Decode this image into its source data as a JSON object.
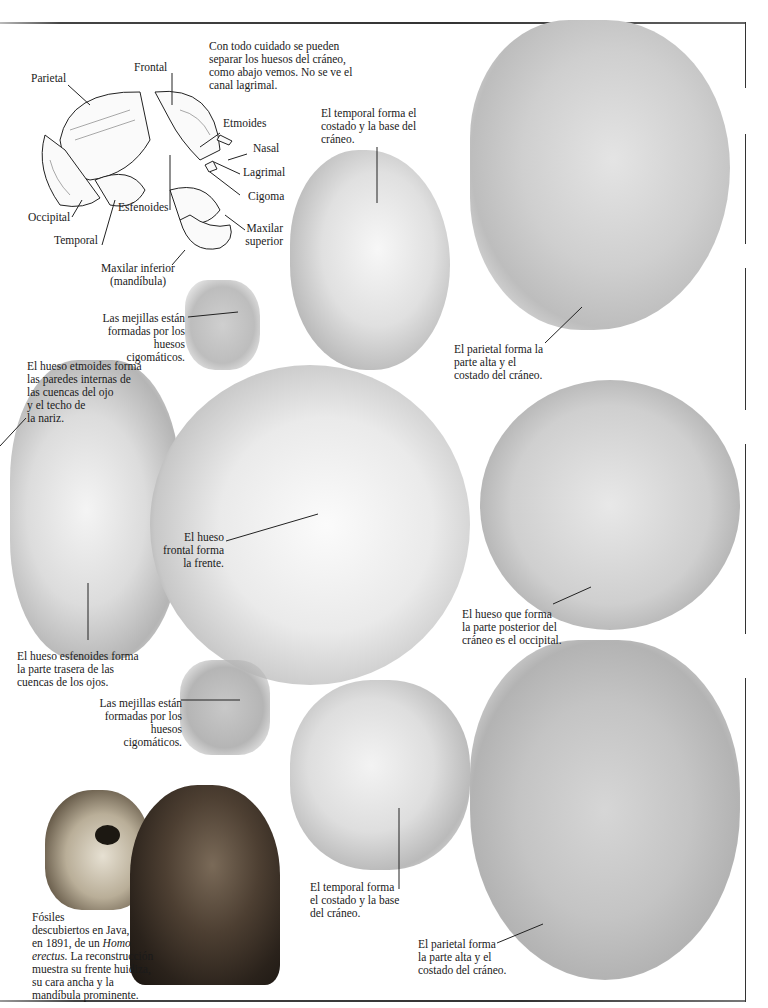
{
  "intro_caption": "Con todo cuidado se pueden\nseparar los huesos del cráneo,\ncomo abajo vemos. No se ve el\ncanal lagrimal.",
  "diagram": {
    "labels": {
      "frontal": "Frontal",
      "parietal": "Parietal",
      "etmoides": "Etmoides",
      "nasal": "Nasal",
      "lagrimal": "Lagrimal",
      "cigoma": "Cigoma",
      "maxilar_superior": "Maxilar\nsuperior",
      "occipital": "Occipital",
      "esfenoides": "Esfenoides",
      "temporal": "Temporal",
      "maxilar_inferior": "Maxilar inferior\n(mandíbula)"
    }
  },
  "captions": {
    "temporal_top": "El temporal forma el\ncostado y la base del\ncráneo.",
    "mejillas_top": "Las mejillas están\nformadas por los\nhuesos cigomáticos.",
    "parietal_top": "El parietal forma la\nparte alta y el\ncostado del cráneo.",
    "etmoides": "El hueso etmoides forma\nlas paredes internas de\nlas cuencas del ojo\ny el techo de\nla nariz.",
    "frontal": "El hueso\nfrontal forma\nla frente.",
    "occipital": "El hueso que forma\nla parte posterior del\ncráneo es el occipital.",
    "esfenoides": "El hueso esfenoides forma\nla parte trasera de las\ncuencas de los ojos.",
    "mejillas_bottom": "Las mejillas están\nformadas por los\nhuesos cigomáticos.",
    "temporal_bottom": "El temporal forma\nel costado y la base\ndel cráneo.",
    "parietal_bottom": "El parietal forma\nla parte alta y el\ncostado del cráneo.",
    "fossil_part1": "Fósiles\ndescubiertos en Java,\nen 1891, de un ",
    "fossil_italic1": "Homo",
    "fossil_italic2": "erectus.",
    "fossil_part2": " La reconstrucción\nmuestra su frente huidiza,\nsu cara ancha y la\nmandíbula prominente."
  },
  "images": {
    "skull_fossil": "Homo erectus fossil skull",
    "reconstruction": "Homo erectus head reconstruction"
  }
}
